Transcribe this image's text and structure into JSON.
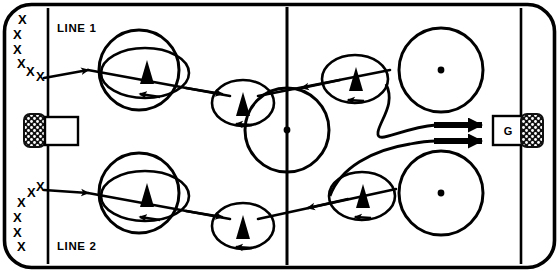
{
  "diagram": {
    "type": "ice-hockey-drill",
    "canvas": {
      "width": 559,
      "height": 272
    },
    "colors": {
      "ink": "#000000",
      "ice": "#ffffff",
      "net_fill": "#1a1a1a"
    }
  },
  "labels": {
    "line1": "LINE 1",
    "line2": "LINE 2",
    "goalie": "G",
    "player_marker": "triangle-up",
    "skater_marker": "X"
  },
  "rink": {
    "border": {
      "outer": {
        "x": 4,
        "y": 4,
        "width": 551,
        "height": 264,
        "corner_radius": 26
      },
      "stroke_width": 3.5
    },
    "center_line": {
      "x": 287,
      "y1": 9,
      "y2": 263,
      "stroke_width": 3
    },
    "goal_line_left": {
      "x": 48,
      "y1": 9,
      "y2": 263,
      "stroke_width": 2.5
    },
    "goal_line_right": {
      "x": 522,
      "y1": 9,
      "y2": 263,
      "stroke_width": 2.5
    },
    "center_circle": {
      "cx": 287,
      "cy": 130,
      "r": 42,
      "stroke_width": 3
    },
    "center_dot": {
      "cx": 287,
      "cy": 130,
      "r": 3.2
    }
  },
  "faceoff_circles": [
    {
      "id": "left-top",
      "cx": 139,
      "cy": 70,
      "r": 40,
      "has_dot": false
    },
    {
      "id": "left-bottom",
      "cx": 139,
      "cy": 193,
      "r": 40,
      "has_dot": false
    },
    {
      "id": "right-top",
      "cx": 441,
      "cy": 70,
      "r": 42,
      "has_dot": true,
      "dot_r": 3.2
    },
    {
      "id": "right-bottom",
      "cx": 441,
      "cy": 193,
      "r": 42,
      "has_dot": true,
      "dot_r": 3.2
    }
  ],
  "goals": [
    {
      "id": "goal-left",
      "crease_box": {
        "x": 46,
        "y": 117,
        "width": 32,
        "height": 27
      },
      "net": {
        "x": 25,
        "y": 116,
        "width": 22,
        "height": 30,
        "corner_radius": 5
      },
      "has_goalie_label": false
    },
    {
      "id": "goal-right",
      "crease_box": {
        "x": 494,
        "y": 117,
        "width": 30,
        "height": 27
      },
      "net": {
        "x": 523,
        "y": 116,
        "width": 22,
        "height": 30,
        "corner_radius": 5
      },
      "has_goalie_label": true,
      "goalie_label_x": 509,
      "goalie_label_y": 135
    }
  ],
  "player_groups": [
    {
      "id": "line1-queue",
      "label_ref": "line1",
      "label_pos": {
        "x": 57,
        "y": 32
      },
      "marks": [
        {
          "x": 14,
          "y": 18
        },
        {
          "x": 11,
          "y": 32
        },
        {
          "x": 11,
          "y": 46
        },
        {
          "x": 15,
          "y": 60
        },
        {
          "x": 24,
          "y": 70
        },
        {
          "x": 34,
          "y": 78
        }
      ]
    },
    {
      "id": "line2-queue",
      "label_ref": "line2",
      "label_pos": {
        "x": 57,
        "y": 248
      },
      "marks": [
        {
          "x": 34,
          "y": 186
        },
        {
          "x": 25,
          "y": 194
        },
        {
          "x": 16,
          "y": 204
        },
        {
          "x": 11,
          "y": 218
        },
        {
          "x": 11,
          "y": 232
        },
        {
          "x": 14,
          "y": 246
        }
      ]
    }
  ],
  "curl_loops": [
    {
      "id": "curl-1",
      "cx": 145,
      "cy": 73,
      "rx": 44,
      "ry": 25,
      "player": {
        "x": 147,
        "y": 74
      }
    },
    {
      "id": "curl-2",
      "cx": 243,
      "cy": 103,
      "rx": 31,
      "ry": 23,
      "player": {
        "x": 243,
        "y": 105
      }
    },
    {
      "id": "curl-3",
      "cx": 355,
      "cy": 79,
      "rx": 33,
      "ry": 24,
      "player": {
        "x": 356,
        "y": 80
      }
    },
    {
      "id": "curl-4",
      "cx": 145,
      "cy": 196,
      "rx": 44,
      "ry": 25,
      "player": {
        "x": 147,
        "y": 197
      }
    },
    {
      "id": "curl-5",
      "cx": 243,
      "cy": 226,
      "rx": 31,
      "ry": 23,
      "player": {
        "x": 243,
        "y": 228
      }
    },
    {
      "id": "curl-6",
      "cx": 362,
      "cy": 196,
      "rx": 33,
      "ry": 24,
      "player": {
        "x": 363,
        "y": 197
      }
    }
  ],
  "skate_paths": [
    {
      "id": "path-line1-out",
      "desc": "Line 1 skates from corner across to center and around circles"
    },
    {
      "id": "path-line2-out",
      "desc": "Line 2 skates from corner across to center and around circles"
    },
    {
      "id": "path-shot-top",
      "desc": "Top shot on net arrow"
    },
    {
      "id": "path-shot-bottom",
      "desc": "Bottom shot on net arrow"
    }
  ],
  "shot_arrows": [
    {
      "id": "shot-top",
      "x1": 436,
      "y1": 125,
      "x2": 492,
      "y2": 125,
      "stroke_width": 6
    },
    {
      "id": "shot-bottom",
      "x1": 436,
      "y1": 141,
      "x2": 492,
      "y2": 141,
      "stroke_width": 6
    }
  ]
}
